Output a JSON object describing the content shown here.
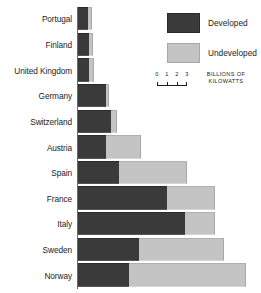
{
  "chart_data": {
    "type": "bar",
    "orientation": "horizontal",
    "stacked": true,
    "title": "",
    "subtitle": "",
    "xlabel": "BILLIONS OF KILOWATTS",
    "ylabel": "",
    "xlim": [
      0,
      18.5
    ],
    "grid": false,
    "legend_position": "top-right",
    "categories": [
      "Portugal",
      "Finland",
      "United Kingdom",
      "Germany",
      "Switzerland",
      "Austria",
      "Spain",
      "France",
      "Italy",
      "Sweden",
      "Norway"
    ],
    "series": [
      {
        "name": "Developed",
        "color": "#3a3a3a",
        "values": [
          1.0,
          1.1,
          1.1,
          2.8,
          3.3,
          2.8,
          4.1,
          9.0,
          10.8,
          6.2,
          5.2
        ]
      },
      {
        "name": "Undeveloped",
        "color": "#c4c4c4",
        "values": [
          0.4,
          0.4,
          0.5,
          0.3,
          0.6,
          3.6,
          6.9,
          4.9,
          3.1,
          8.6,
          11.8
        ]
      }
    ],
    "axis_scale": {
      "ticks": [
        0,
        1,
        2,
        3
      ],
      "tick_labels": [
        "0",
        "1",
        "2",
        "3"
      ],
      "unit_caption_line1": "BILLIONS OF",
      "unit_caption_line2": "KILOWATTS"
    }
  },
  "legend": {
    "items": [
      {
        "label": "Developed",
        "swatch": "dark"
      },
      {
        "label": "Undeveloped",
        "swatch": "light"
      }
    ]
  },
  "colors": {
    "developed": "#3a3a3a",
    "undeveloped": "#c4c4c4",
    "text": "#1c1c1c",
    "background": "#ffffff"
  }
}
